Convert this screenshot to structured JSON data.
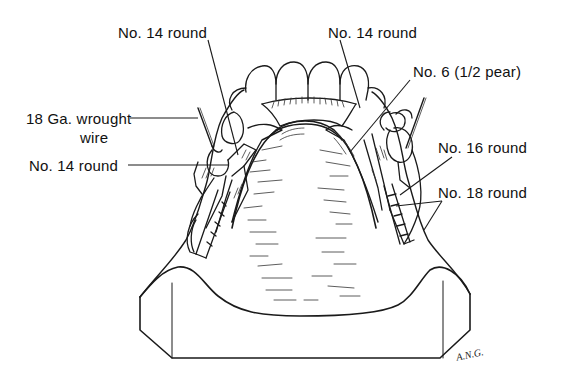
{
  "figure": {
    "signature": "A.N.G."
  },
  "labels": {
    "top_left": "No. 14 round",
    "top_center": "No. 14 round",
    "pear": "No. 6 (1/2 pear)",
    "wire_line1": "18 Ga. wrought",
    "wire_line2": "wire",
    "mid_left": "No. 14 round",
    "right_16": "No. 16 round",
    "right_18": "No. 18 round"
  },
  "colors": {
    "ink": "#1a1a1a",
    "background": "#ffffff"
  }
}
